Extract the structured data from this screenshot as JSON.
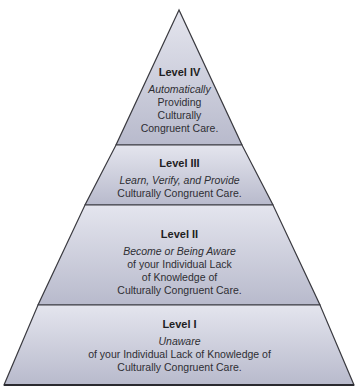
{
  "diagram": {
    "type": "pyramid",
    "colors": {
      "fill_top": "#dcdde8",
      "fill_bottom": "#b9bbcd",
      "stroke": "#3a3a40",
      "text": "#2e2e33",
      "title_text": "#1e1e22"
    },
    "levels": [
      {
        "id": "level-4",
        "title": "Level IV",
        "lines": [
          {
            "text": "Automatically",
            "italic": true
          },
          {
            "text": "Providing",
            "italic": false
          },
          {
            "text": "Culturally",
            "italic": false
          },
          {
            "text": "Congruent Care.",
            "italic": false
          }
        ]
      },
      {
        "id": "level-3",
        "title": "Level III",
        "lines": [
          {
            "text": "Learn, Verify, and Provide",
            "italic": true
          },
          {
            "text": "Culturally Congruent Care.",
            "italic": false
          }
        ]
      },
      {
        "id": "level-2",
        "title": "Level II",
        "lines": [
          {
            "text": "Become or Being Aware",
            "italic": true
          },
          {
            "text": "of your Individual Lack",
            "italic": false
          },
          {
            "text": "of Knowledge of",
            "italic": false
          },
          {
            "text": "Culturally Congruent Care.",
            "italic": false
          }
        ]
      },
      {
        "id": "level-1",
        "title": "Level I",
        "lines": [
          {
            "text": "Unaware",
            "italic": true
          },
          {
            "text": "of your Individual Lack of Knowledge of",
            "italic": false
          },
          {
            "text": "Culturally Congruent Care.",
            "italic": false
          }
        ]
      }
    ]
  }
}
